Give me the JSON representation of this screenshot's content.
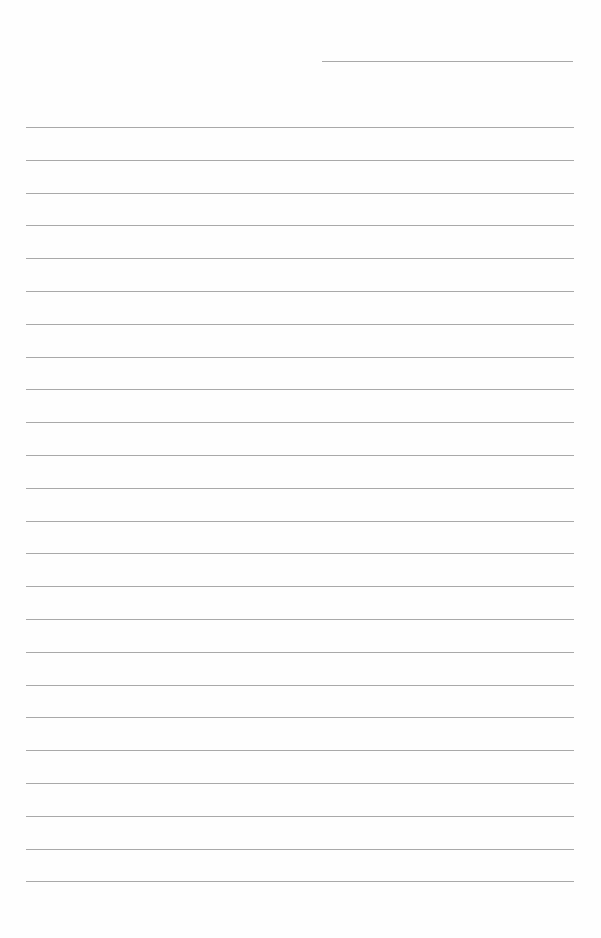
{
  "page": {
    "type": "lined-paper",
    "background_color": "#ffffff",
    "line_color": "#9a9a9a",
    "header_line": {
      "y": 61,
      "x_start": 322,
      "x_end": 573
    },
    "ruled_lines": {
      "count": 24,
      "first_y": 127,
      "spacing": 32.8,
      "x_start": 26,
      "x_end": 574
    },
    "text_content": []
  }
}
